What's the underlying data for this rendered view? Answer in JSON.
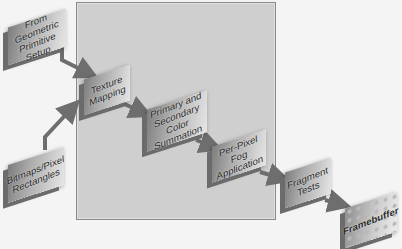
{
  "diagram": {
    "type": "pipeline-flow",
    "stages": [
      {
        "id": "geometric",
        "label": "From Geometric Primitive Setup"
      },
      {
        "id": "bitmaps",
        "label": "Bitmaps/Pixel Rectangles"
      },
      {
        "id": "texture",
        "label": "Texture Mapping"
      },
      {
        "id": "color-sum",
        "label": "Primary and Secondary Color Summation"
      },
      {
        "id": "fog",
        "label": "Per-Pixel Fog Application"
      },
      {
        "id": "fragment",
        "label": "Fragment Tests"
      },
      {
        "id": "framebuffer",
        "label": "Framebuffer"
      }
    ],
    "edges": [
      {
        "from": "geometric",
        "to": "texture"
      },
      {
        "from": "bitmaps",
        "to": "texture"
      },
      {
        "from": "texture",
        "to": "color-sum"
      },
      {
        "from": "color-sum",
        "to": "fog"
      },
      {
        "from": "fog",
        "to": "fragment"
      },
      {
        "from": "fragment",
        "to": "framebuffer"
      }
    ],
    "highlight_panel": {
      "contains": [
        "texture",
        "color-sum",
        "fog"
      ]
    },
    "colors": {
      "background": "#f4f4f4",
      "panel": "#cfcfcf",
      "arrow": "#6e6e6e"
    }
  }
}
